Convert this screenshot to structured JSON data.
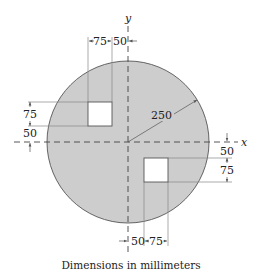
{
  "diagram": {
    "type": "engineering-drawing",
    "colors": {
      "plate_fill": "#cdcdcd",
      "plate_stroke": "#555555",
      "hole_fill": "#ffffff",
      "line": "#666666",
      "axis": "#444444",
      "text": "#222222"
    },
    "axes": {
      "x_label": "x",
      "y_label": "y"
    },
    "plate": {
      "radius_label": "250"
    },
    "hole_top_left": {
      "width_label": "75",
      "offset_x_label": "50",
      "height_label": "75",
      "offset_y_label": "50"
    },
    "hole_bottom_right": {
      "width_label": "75",
      "offset_x_label": "50",
      "height_label": "75",
      "offset_y_label": "50"
    },
    "caption": "Dimensions in millimeters"
  }
}
